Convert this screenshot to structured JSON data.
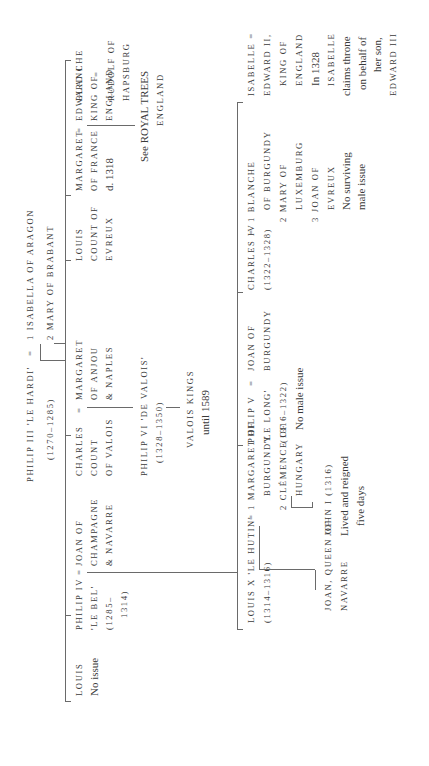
{
  "diagram": {
    "orientation": "rotated 90 degrees counter-clockwise",
    "root": {
      "name": "PHILIP III 'LE HARDI'",
      "eq": "=",
      "dates": "(1270–1285)",
      "spouse1": "1 ISABELLA OF ARAGON",
      "spouse2": "2 MARY OF BRABANT"
    },
    "gen2": {
      "louis": {
        "name": "LOUIS",
        "note": "No issue"
      },
      "philip4": {
        "name": "PHILIP IV",
        "eq": "=",
        "epithet": "'LE BEL'",
        "dates1": "(1285–",
        "dates2": "1314)",
        "spouse_l1": "JOAN OF",
        "spouse_l2": "CHAMPAGNE",
        "spouse_l3": "& NAVARRE"
      },
      "charles": {
        "name": "CHARLES",
        "eq": "=",
        "title1": "COUNT",
        "title2": "OF VALOIS",
        "spouse_l1": "MARGARET",
        "spouse_l2": "OF ANJOU",
        "spouse_l3": "& NAPLES",
        "child_name": "PHILIP VI 'DE VALOIS'",
        "child_dates": "(1328–1350)",
        "grandchild_l1": "VALOIS KINGS",
        "grandchild_l2": "until 1589"
      },
      "louis_evreux": {
        "l1": "LOUIS",
        "l2": "COUNT OF",
        "l3": "EVREUX"
      },
      "margaret": {
        "name": "MARGARET",
        "eq": "=",
        "l2": "OF FRANCE",
        "l3": "d. 1318",
        "spouse_l1": "EDWARD I",
        "spouse_l2": "KING OF",
        "spouse_l3": "ENGLAND",
        "ref_l1": "See ROYAL TREES",
        "ref_l2": "ENGLAND"
      },
      "blanche": {
        "name": "BLANCHE",
        "eq": "=",
        "spouse_l1": "RUDOLF OF",
        "spouse_l2": "HAPSBURG"
      }
    },
    "gen3": {
      "louis10": {
        "name": "LOUIS X 'LE HUTIN'",
        "eq": "=",
        "dates": "(1314–1316)",
        "spouse1_l1": "1 MARGARET OF",
        "spouse1_l2": "BURGUNDY",
        "spouse2_l1": "2 CLÉMENCE OF",
        "spouse2_l2": "HUNGARY",
        "child1_l1": "JOAN, QUEEN OF",
        "child1_l2": "NAVARRE",
        "child2_l1": "JOHN I (1316)",
        "child2_l2": "Lived and reigned",
        "child2_l3": "five days"
      },
      "philip5": {
        "name": "PHILIP V",
        "eq": "=",
        "epithet": "'LE LONG'",
        "dates": "(1316–1322)",
        "note": "No male issue",
        "spouse_l1": "JOAN OF",
        "spouse_l2": "BURGUNDY"
      },
      "charles4": {
        "name": "CHARLES IV",
        "eq": "=",
        "dates": "(1322–1328)",
        "s1_l1": "1 BLANCHE",
        "s1_l2": "OF BURGUNDY",
        "s2_l1": "2 MARY OF",
        "s2_l2": "LUXEMBURG",
        "s3_l1": "3 JOAN OF",
        "s3_l2": "EVREUX",
        "note_l1": "No surviving",
        "note_l2": "male issue"
      },
      "isabelle": {
        "name": "ISABELLE =",
        "l2": "EDWARD II,",
        "l3": "KING OF",
        "l4": "ENGLAND",
        "l5": "In 1328",
        "l6": "ISABELLE",
        "l7": "claims throne",
        "l8": "on behalf of",
        "l9": "her son,",
        "l10": "EDWARD III"
      }
    }
  }
}
